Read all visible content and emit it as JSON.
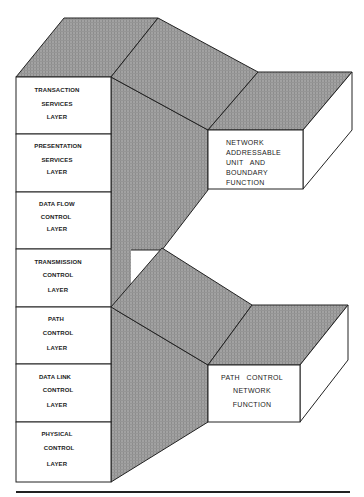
{
  "diagram": {
    "type": "layered architecture block diagram",
    "layers": [
      {
        "lines": [
          "TRANSACTION",
          "SERVICES",
          "LAYER"
        ]
      },
      {
        "lines": [
          "PRESENTATION",
          "SERVICES",
          "LAYER"
        ]
      },
      {
        "lines": [
          "DATA FLOW",
          "CONTROL",
          "LAYER"
        ]
      },
      {
        "lines": [
          "TRANSMISSION",
          "CONTROL",
          "LAYER"
        ]
      },
      {
        "lines": [
          "PATH",
          "CONTROL",
          "LAYER"
        ]
      },
      {
        "lines": [
          "DATA LINK",
          "CONTROL",
          "LAYER"
        ]
      },
      {
        "lines": [
          "PHYSICAL",
          "CONTROL",
          "LAYER"
        ]
      }
    ],
    "groups": {
      "upper": {
        "lines": [
          "NETWORK",
          "ADDRESSABLE",
          "UNIT   AND",
          "BOUNDARY",
          "FUNCTION"
        ]
      },
      "lower": {
        "lines": [
          "PATH   CONTROL",
          "NETWORK",
          "FUNCTION"
        ]
      }
    },
    "colors": {
      "shade": "#9a9a9a",
      "line": "#222222",
      "face": "#ffffff"
    }
  }
}
